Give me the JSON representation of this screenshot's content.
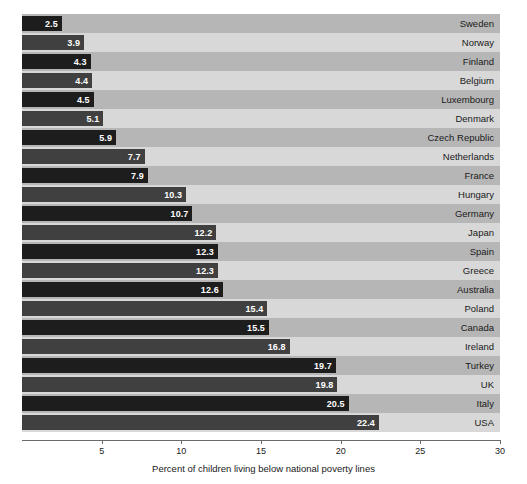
{
  "chart_data": {
    "type": "bar",
    "orientation": "horizontal",
    "title": "",
    "xlabel": "Percent of children living below national poverty lines",
    "ylabel": "",
    "xlim": [
      0,
      30
    ],
    "xticks": [
      5,
      10,
      15,
      20,
      25,
      30
    ],
    "grid": true,
    "legend": "none",
    "categories": [
      "Sweden",
      "Norway",
      "Finland",
      "Belgium",
      "Luxembourg",
      "Denmark",
      "Czech Republic",
      "Netherlands",
      "France",
      "Hungary",
      "Germany",
      "Japan",
      "Spain",
      "Greece",
      "Australia",
      "Poland",
      "Canada",
      "Ireland",
      "Turkey",
      "UK",
      "Italy",
      "USA",
      "Mexico"
    ],
    "values": [
      2.5,
      3.9,
      4.3,
      4.4,
      4.5,
      5.1,
      5.9,
      7.7,
      7.9,
      10.3,
      10.7,
      12.2,
      12.3,
      12.3,
      12.6,
      15.4,
      15.5,
      16.8,
      19.7,
      19.8,
      20.5,
      22.4,
      26.2
    ],
    "value_labels": [
      "2.5",
      "3.9",
      "4.3",
      "4.4",
      "4.5",
      "5.1",
      "5.9",
      "7.7",
      "7.9",
      "10.3",
      "10.7",
      "12.2",
      "12.3",
      "12.3",
      "12.6",
      "15.4",
      "15.5",
      "16.8",
      "19.7",
      "19.8",
      "20.5",
      "22.4",
      "26.2"
    ],
    "tick_labels": [
      "5",
      "10",
      "15",
      "20",
      "25",
      "30"
    ],
    "colors": {
      "bar_dark": "#1d1d1d",
      "bar_mid": "#404040",
      "band_dark": "#b6b6b6",
      "band_light": "#d8d8d8",
      "plot_background": "#d5d5d5",
      "gridline": "#ffffff",
      "axis": "#6a6a6a",
      "value_text": "#ffffff",
      "label_text": "#1a1a1a",
      "page_background": "#ffffff"
    }
  }
}
